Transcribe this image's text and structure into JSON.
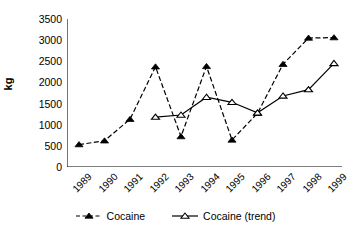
{
  "chart_data": {
    "type": "line",
    "title": "",
    "xlabel": "",
    "ylabel": "kg",
    "categories": [
      "1989",
      "1990",
      "1991",
      "1992",
      "1993",
      "1994",
      "1995",
      "1996",
      "1997",
      "1998",
      "1999"
    ],
    "ylim": [
      0,
      3500
    ],
    "yticks": [
      0,
      500,
      1000,
      1500,
      2000,
      2500,
      3000,
      3500
    ],
    "ytick_labels": [
      "0",
      "500",
      "1000",
      "1500",
      "2000",
      "2500",
      "3000",
      "3500"
    ],
    "grid": false,
    "legend_position": "bottom",
    "series": [
      {
        "name": "Cocaine",
        "marker": "filled-triangle",
        "line_style": "dashed",
        "color": "#000000",
        "x": [
          "1989",
          "1990",
          "1991",
          "1992",
          "1993",
          "1994",
          "1995",
          "1996",
          "1997",
          "1998",
          "1999"
        ],
        "values": [
          530,
          620,
          1130,
          2370,
          720,
          2380,
          640,
          1270,
          2430,
          3050,
          3060
        ]
      },
      {
        "name": "Cocaine (trend)",
        "marker": "hollow-triangle",
        "line_style": "solid",
        "color": "#000000",
        "x": [
          "1992",
          "1993",
          "1994",
          "1995",
          "1996",
          "1997",
          "1998",
          "1999"
        ],
        "values": [
          1180,
          1230,
          1650,
          1530,
          1280,
          1680,
          1830,
          2450
        ]
      }
    ]
  },
  "axes": {
    "y_axis_label": "kg"
  },
  "legend": {
    "items": [
      {
        "label": "Cocaine"
      },
      {
        "label": "Cocaine (trend)"
      }
    ]
  }
}
